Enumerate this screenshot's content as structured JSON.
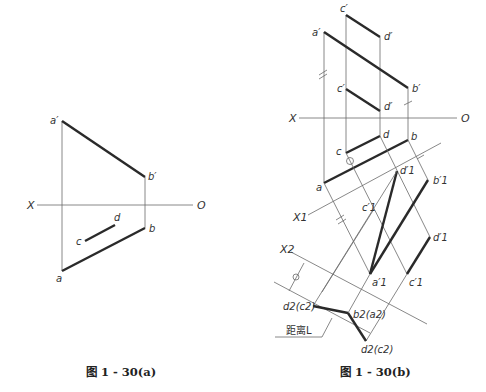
{
  "figure_a": {
    "caption": "图 1 - 30(a)",
    "axis": {
      "left": "X",
      "right": "O"
    },
    "labels": {
      "a_prime": "a′",
      "b_prime": "b′",
      "a": "a",
      "b": "b",
      "c": "c",
      "d": "d"
    }
  },
  "figure_b": {
    "caption": "图 1 - 30(b)",
    "axis": {
      "left": "X",
      "right": "O"
    },
    "axis_x1": "X1",
    "axis_x2": "X2",
    "labels": {
      "c_prime_top": "c′",
      "d_prime_top": "d′",
      "a_prime": "a′",
      "b_prime": "b′",
      "c_prime_mid": "c′",
      "d_prime_mid": "d′",
      "d": "d",
      "b": "b",
      "c": "c",
      "a": "a",
      "d1_prime_top": "d′1",
      "b1_prime": "b′1",
      "c1_prime_top": "c′1",
      "d1_prime_low": "d′1",
      "a1_prime": "a′1",
      "c1_prime_low": "c′1",
      "d2c2_left": "d2(c2)",
      "b2a2": "b2(a2)",
      "d2c2_bottom": "d2(c2)",
      "distance": "距离L"
    }
  }
}
